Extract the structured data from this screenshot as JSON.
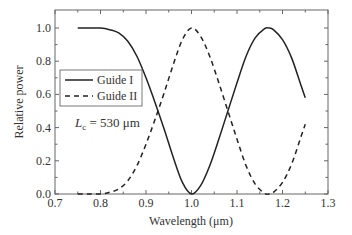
{
  "chart_data": {
    "type": "line",
    "title": "",
    "xlabel": "Wavelength (μm)",
    "ylabel": "Relative power",
    "xlim": [
      0.7,
      1.3
    ],
    "ylim": [
      0.0,
      1.05
    ],
    "xticks": [
      0.7,
      0.8,
      0.9,
      1.0,
      1.1,
      1.2,
      1.3
    ],
    "xtick_labels": [
      "0.7",
      "0.8",
      "0.9",
      "1.0",
      "1.1",
      "1.2",
      "1.3"
    ],
    "yticks": [
      0.0,
      0.2,
      0.4,
      0.6,
      0.8,
      1.0
    ],
    "ytick_labels": [
      "0.0",
      "0.2",
      "0.4",
      "0.6",
      "0.8",
      "1.0"
    ],
    "grid": false,
    "legend_position": "upper-left (inside)",
    "annotation": {
      "text_main": "L",
      "text_sub": "c",
      "text_rest": " = 530 μm"
    },
    "x": [
      0.75,
      0.775,
      0.8,
      0.82,
      0.84,
      0.86,
      0.88,
      0.9,
      0.92,
      0.94,
      0.96,
      0.98,
      1.0,
      1.02,
      1.04,
      1.06,
      1.08,
      1.1,
      1.12,
      1.14,
      1.16,
      1.17,
      1.18,
      1.2,
      1.22,
      1.24,
      1.25
    ],
    "series": [
      {
        "name": "Guide I",
        "style": "solid",
        "color": "#222222",
        "values": [
          1.0,
          1.0,
          1.0,
          0.99,
          0.97,
          0.92,
          0.83,
          0.7,
          0.55,
          0.39,
          0.22,
          0.07,
          0.0,
          0.05,
          0.17,
          0.33,
          0.5,
          0.67,
          0.83,
          0.94,
          0.995,
          1.0,
          0.99,
          0.93,
          0.82,
          0.66,
          0.58
        ]
      },
      {
        "name": "Guide II",
        "style": "dashed",
        "color": "#222222",
        "values": [
          0.0,
          0.0,
          0.0,
          0.01,
          0.03,
          0.08,
          0.17,
          0.3,
          0.45,
          0.61,
          0.78,
          0.93,
          1.0,
          0.95,
          0.83,
          0.67,
          0.5,
          0.33,
          0.17,
          0.06,
          0.005,
          0.0,
          0.01,
          0.07,
          0.18,
          0.34,
          0.42
        ]
      }
    ]
  }
}
